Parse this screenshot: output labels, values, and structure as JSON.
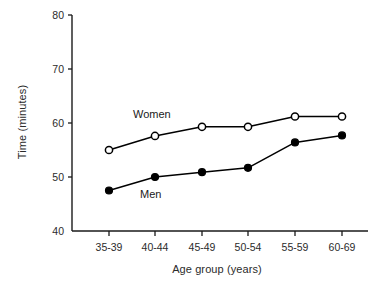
{
  "chart_data": {
    "type": "line",
    "title": "",
    "xlabel": "Age group (years)",
    "ylabel": "Time (minutes)",
    "categories": [
      "35-39",
      "40-44",
      "45-49",
      "50-54",
      "55-59",
      "60-69"
    ],
    "ylim": [
      40,
      80
    ],
    "yticks": [
      40,
      50,
      60,
      70,
      80
    ],
    "ytick_labels": [
      "40",
      "50",
      "60",
      "70",
      "80"
    ],
    "grid": false,
    "legend_position": "inline-annotations",
    "series": [
      {
        "name": "Women",
        "marker": "open-circle",
        "color": "#000000",
        "values": [
          55.0,
          57.6,
          59.3,
          59.3,
          61.2,
          61.2
        ]
      },
      {
        "name": "Men",
        "marker": "filled-circle",
        "color": "#000000",
        "values": [
          47.5,
          50.0,
          50.9,
          51.7,
          56.4,
          57.7
        ]
      }
    ],
    "annotations": [
      {
        "text": "Women",
        "series": "Women"
      },
      {
        "text": "Men",
        "series": "Men"
      }
    ]
  },
  "axes": {
    "y_tick_labels": [
      "80",
      "70",
      "60",
      "50",
      "40"
    ],
    "x_tick_labels": [
      "35-39",
      "40-44",
      "45-49",
      "50-54",
      "55-59",
      "60-69"
    ],
    "y_title": "Time (minutes)",
    "x_title": "Age group (years)"
  },
  "colors": {
    "axis": "#1a1a1a",
    "line": "#000000",
    "marker_fill_open": "#ffffff",
    "marker_fill_closed": "#000000",
    "background": "#ffffff"
  }
}
